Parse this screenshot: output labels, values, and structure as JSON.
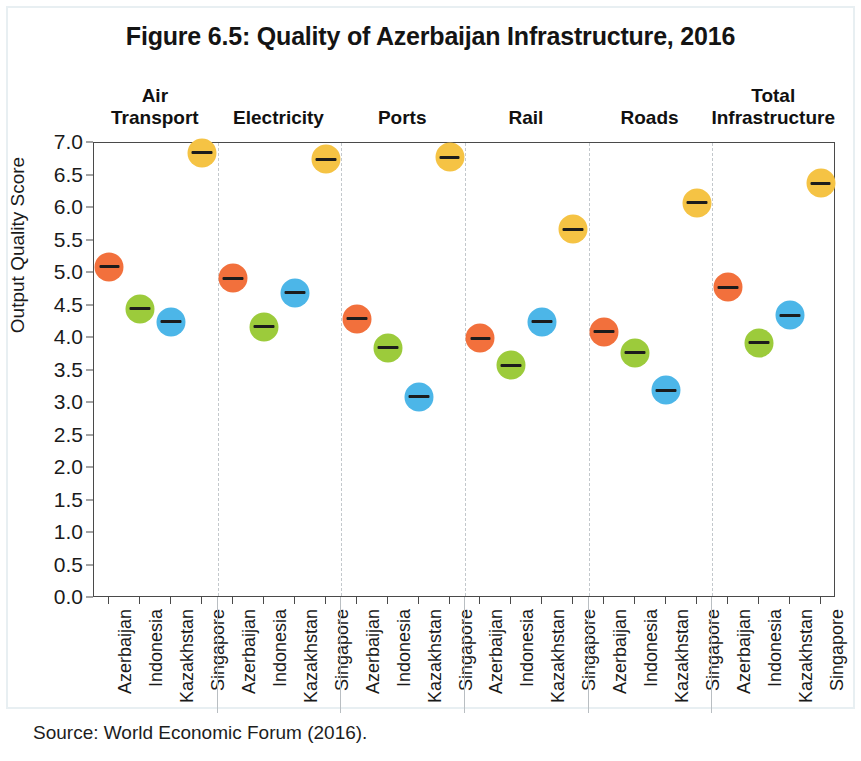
{
  "figure": {
    "title": "Figure 6.5: Quality of Azerbaijan Infrastructure, 2016",
    "source": "Source: World Economic Forum (2016)."
  },
  "chart_data": {
    "type": "scatter",
    "title": "Figure 6.5: Quality of Azerbaijan Infrastructure, 2016",
    "xlabel": "",
    "ylabel": "Output Quality Score",
    "ylim": [
      0.0,
      7.0
    ],
    "ytick_labels": [
      "0.0",
      "0.5",
      "1.0",
      "1.5",
      "2.0",
      "2.5",
      "3.0",
      "3.5",
      "4.0",
      "4.5",
      "5.0",
      "5.5",
      "6.0",
      "6.5",
      "7.0"
    ],
    "ytick_values": [
      0.0,
      0.5,
      1.0,
      1.5,
      2.0,
      2.5,
      3.0,
      3.5,
      4.0,
      4.5,
      5.0,
      5.5,
      6.0,
      6.5,
      7.0
    ],
    "grid": false,
    "legend": "none",
    "categories": [
      "Azerbaijan",
      "Indonesia",
      "Kazakhstan",
      "Singapore"
    ],
    "category_colors": {
      "Azerbaijan": "#f2703c",
      "Indonesia": "#9ccb3b",
      "Kazakhstan": "#4cb6e8",
      "Singapore": "#f5c344"
    },
    "groups": [
      {
        "label": "Air\nTransport",
        "label_lines": [
          "Air",
          "Transport"
        ],
        "points": [
          {
            "category": "Azerbaijan",
            "value": 5.1
          },
          {
            "category": "Indonesia",
            "value": 4.45
          },
          {
            "category": "Kazakhstan",
            "value": 4.25
          },
          {
            "category": "Singapore",
            "value": 6.85
          }
        ]
      },
      {
        "label": "Electricity",
        "label_lines": [
          "Electricity"
        ],
        "points": [
          {
            "category": "Azerbaijan",
            "value": 4.92
          },
          {
            "category": "Indonesia",
            "value": 4.17
          },
          {
            "category": "Kazakhstan",
            "value": 4.7
          },
          {
            "category": "Singapore",
            "value": 6.75
          }
        ]
      },
      {
        "label": "Ports",
        "label_lines": [
          "Ports"
        ],
        "points": [
          {
            "category": "Azerbaijan",
            "value": 4.3
          },
          {
            "category": "Indonesia",
            "value": 3.85
          },
          {
            "category": "Kazakhstan",
            "value": 3.1
          },
          {
            "category": "Singapore",
            "value": 6.78
          }
        ]
      },
      {
        "label": "Rail",
        "label_lines": [
          "Rail"
        ],
        "points": [
          {
            "category": "Azerbaijan",
            "value": 4.0
          },
          {
            "category": "Indonesia",
            "value": 3.58
          },
          {
            "category": "Kazakhstan",
            "value": 4.25
          },
          {
            "category": "Singapore",
            "value": 5.67
          }
        ]
      },
      {
        "label": "Roads",
        "label_lines": [
          "Roads"
        ],
        "points": [
          {
            "category": "Azerbaijan",
            "value": 4.1
          },
          {
            "category": "Indonesia",
            "value": 3.77
          },
          {
            "category": "Kazakhstan",
            "value": 3.2
          },
          {
            "category": "Singapore",
            "value": 6.08
          }
        ]
      },
      {
        "label": "Total\nInfrastructure",
        "label_lines": [
          "Total",
          "Infrastructure"
        ],
        "points": [
          {
            "category": "Azerbaijan",
            "value": 4.78
          },
          {
            "category": "Indonesia",
            "value": 3.93
          },
          {
            "category": "Kazakhstan",
            "value": 4.35
          },
          {
            "category": "Singapore",
            "value": 6.38
          }
        ]
      }
    ]
  }
}
